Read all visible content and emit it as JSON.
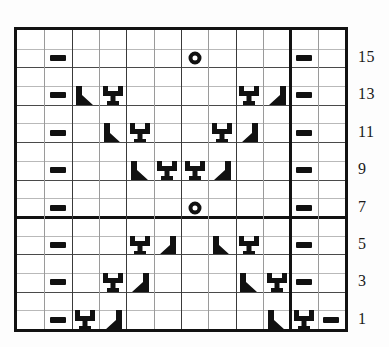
{
  "chart": {
    "type": "knitting-chart",
    "columns": 12,
    "rows": 16,
    "row_labels": [
      "15",
      "13",
      "11",
      "9",
      "7",
      "5",
      "3",
      "1"
    ],
    "row_label_rows": [
      15,
      13,
      11,
      9,
      7,
      5,
      3,
      1
    ],
    "heavy_row_divider_after_row": 6,
    "heavy_column_divider_after_column": 10,
    "symbols": {
      "dash": "purl-bar",
      "circle": "yarn-over-ring",
      "right_diagonal": "right-leaning-decrease",
      "left_diagonal": "left-leaning-decrease",
      "stitch_y": "raised-stitch"
    },
    "cells": [
      {
        "row": 15,
        "col": 2,
        "symbol": "dash"
      },
      {
        "row": 15,
        "col": 7,
        "symbol": "circle"
      },
      {
        "row": 15,
        "col": 11,
        "symbol": "dash"
      },
      {
        "row": 13,
        "col": 2,
        "symbol": "dash"
      },
      {
        "row": 13,
        "col": 3,
        "symbol": "right_diagonal"
      },
      {
        "row": 13,
        "col": 4,
        "symbol": "stitch_y"
      },
      {
        "row": 13,
        "col": 9,
        "symbol": "stitch_y"
      },
      {
        "row": 13,
        "col": 10,
        "symbol": "left_diagonal"
      },
      {
        "row": 13,
        "col": 11,
        "symbol": "dash"
      },
      {
        "row": 11,
        "col": 2,
        "symbol": "dash"
      },
      {
        "row": 11,
        "col": 4,
        "symbol": "right_diagonal"
      },
      {
        "row": 11,
        "col": 5,
        "symbol": "stitch_y"
      },
      {
        "row": 11,
        "col": 8,
        "symbol": "stitch_y"
      },
      {
        "row": 11,
        "col": 9,
        "symbol": "left_diagonal"
      },
      {
        "row": 11,
        "col": 11,
        "symbol": "dash"
      },
      {
        "row": 9,
        "col": 2,
        "symbol": "dash"
      },
      {
        "row": 9,
        "col": 5,
        "symbol": "right_diagonal"
      },
      {
        "row": 9,
        "col": 6,
        "symbol": "stitch_y"
      },
      {
        "row": 9,
        "col": 7,
        "symbol": "stitch_y"
      },
      {
        "row": 9,
        "col": 8,
        "symbol": "left_diagonal"
      },
      {
        "row": 9,
        "col": 11,
        "symbol": "dash"
      },
      {
        "row": 7,
        "col": 2,
        "symbol": "dash"
      },
      {
        "row": 7,
        "col": 7,
        "symbol": "circle"
      },
      {
        "row": 7,
        "col": 11,
        "symbol": "dash"
      },
      {
        "row": 5,
        "col": 2,
        "symbol": "dash"
      },
      {
        "row": 5,
        "col": 5,
        "symbol": "stitch_y"
      },
      {
        "row": 5,
        "col": 6,
        "symbol": "left_diagonal"
      },
      {
        "row": 5,
        "col": 8,
        "symbol": "right_diagonal"
      },
      {
        "row": 5,
        "col": 9,
        "symbol": "stitch_y"
      },
      {
        "row": 5,
        "col": 11,
        "symbol": "dash"
      },
      {
        "row": 3,
        "col": 2,
        "symbol": "dash"
      },
      {
        "row": 3,
        "col": 4,
        "symbol": "stitch_y"
      },
      {
        "row": 3,
        "col": 5,
        "symbol": "left_diagonal"
      },
      {
        "row": 3,
        "col": 9,
        "symbol": "right_diagonal"
      },
      {
        "row": 3,
        "col": 10,
        "symbol": "stitch_y"
      },
      {
        "row": 3,
        "col": 11,
        "symbol": "dash"
      },
      {
        "row": 1,
        "col": 2,
        "symbol": "dash"
      },
      {
        "row": 1,
        "col": 3,
        "symbol": "stitch_y"
      },
      {
        "row": 1,
        "col": 4,
        "symbol": "left_diagonal"
      },
      {
        "row": 1,
        "col": 10,
        "symbol": "right_diagonal"
      },
      {
        "row": 1,
        "col": 11,
        "symbol": "stitch_y"
      },
      {
        "row": 1,
        "col": 12,
        "symbol": "dash"
      }
    ],
    "colors": {
      "ink": "#121212",
      "grid_light": "#b9b9b9",
      "grid_major": "#4a4a4a",
      "background": "#ffffff"
    }
  }
}
